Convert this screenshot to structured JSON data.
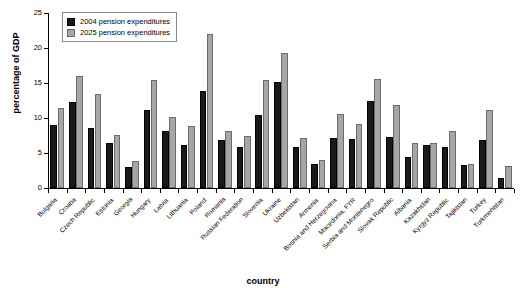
{
  "chart_data": {
    "type": "bar",
    "title": "",
    "xlabel": "country",
    "ylabel": "percentage of GDP",
    "ylim": [
      0,
      25
    ],
    "yticks": [
      0,
      5,
      10,
      15,
      20,
      25
    ],
    "grid": false,
    "legend_position": "top-left",
    "categories": [
      "Bulgaria",
      "Croatia",
      "Czech Republic",
      "Estonia",
      "Georgia",
      "Hungary",
      "Latvia",
      "Lithuania",
      "Poland",
      "Romania",
      "Russian Federation",
      "Slovenia",
      "Ukraine",
      "Uzbekistan",
      "Armenia",
      "Bosnia and Herzegovina",
      "Macedonia, FYR",
      "Serbia and Montenegro",
      "Slovak Republic",
      "Albania",
      "Kazakhstan",
      "Kyrgyz Republic",
      "Tajikistan",
      "Turkey",
      "Turkmenistan"
    ],
    "series": [
      {
        "name": "2004 pension expenditures",
        "color": "#1a1a1a",
        "values": [
          9.0,
          12.3,
          8.6,
          6.4,
          3.0,
          11.1,
          8.1,
          6.2,
          13.9,
          6.9,
          5.8,
          10.5,
          15.2,
          5.8,
          3.5,
          7.2,
          7.0,
          12.4,
          7.3,
          4.4,
          6.2,
          5.9,
          3.3,
          6.8,
          1.5
        ]
      },
      {
        "name": "2025 pension expenditures",
        "color": "#a6a6a6",
        "values": [
          11.4,
          16.0,
          13.4,
          7.6,
          3.9,
          15.4,
          10.2,
          8.9,
          22.0,
          8.1,
          7.4,
          15.4,
          19.3,
          7.1,
          4.0,
          10.6,
          9.2,
          15.6,
          11.8,
          6.5,
          6.5,
          8.1,
          3.5,
          11.1,
          3.1
        ]
      }
    ]
  },
  "legend": {
    "items": [
      {
        "label": "2004 pension expenditures"
      },
      {
        "label": "2025 pension expenditures"
      }
    ]
  }
}
